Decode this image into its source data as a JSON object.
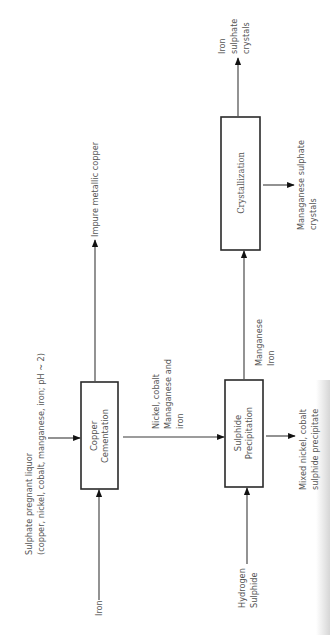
{
  "diagram": {
    "orientation": "rotated-90-ccw",
    "boxes": {
      "copper_cementation": {
        "lines": [
          "Copper",
          "Cementation"
        ]
      },
      "sulphide_precipitation": {
        "lines": [
          "Sulphide",
          "Precipitation"
        ]
      },
      "crystallization": {
        "lines": [
          "Crystallization"
        ]
      }
    },
    "labels": {
      "feed": [
        "Sulphate pregnant liquor",
        "(copper, nickel, cobalt, manganese, iron; pH ~ 2)"
      ],
      "iron_input": [
        "Iron"
      ],
      "hydrogen_sulphide_input": [
        "Hydrogen",
        "Sulphide"
      ],
      "impure_copper_output": [
        "Impure metallic copper"
      ],
      "nickel_cobalt_stream": [
        "Nickel, cobalt",
        "Managanese and",
        "iron"
      ],
      "mixed_precipitate_output": [
        "Mixed nickel, cobalt",
        "sulphide precipitate"
      ],
      "manganese_iron_stream": [
        "Manganese",
        "Iron"
      ],
      "iron_sulphate_output": [
        "Iron",
        "sulphate",
        "crystals"
      ],
      "manganese_sulphate_output": [
        "Managanese sulphate",
        "crystals"
      ]
    },
    "edges": [
      {
        "from": "feed",
        "to": "copper_cementation"
      },
      {
        "from": "iron_input",
        "to": "copper_cementation"
      },
      {
        "from": "copper_cementation",
        "to": "impure_copper_output"
      },
      {
        "from": "copper_cementation",
        "to": "sulphide_precipitation",
        "label": "nickel_cobalt_stream"
      },
      {
        "from": "hydrogen_sulphide_input",
        "to": "sulphide_precipitation"
      },
      {
        "from": "sulphide_precipitation",
        "to": "mixed_precipitate_output"
      },
      {
        "from": "sulphide_precipitation",
        "to": "crystallization",
        "label": "manganese_iron_stream"
      },
      {
        "from": "crystallization",
        "to": "iron_sulphate_output"
      },
      {
        "from": "crystallization",
        "to": "manganese_sulphate_output"
      }
    ]
  }
}
